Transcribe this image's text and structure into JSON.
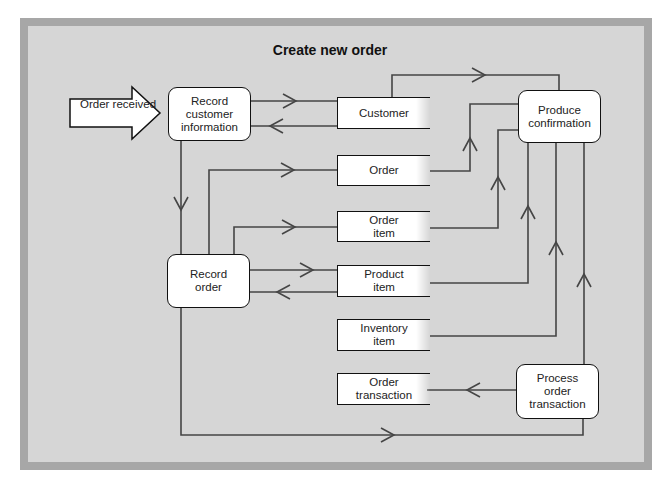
{
  "diagram": {
    "title": "Create new order",
    "external_input": {
      "label": "Order received"
    },
    "processes": {
      "record_customer_information": "Record\ncustomer\ninformation",
      "record_order": "Record\norder",
      "produce_confirmation": "Produce\nconfirmation",
      "process_order_transaction": "Process\norder\ntransaction"
    },
    "data_stores": {
      "customer": "Customer",
      "order": "Order",
      "order_item": "Order\nitem",
      "product_item": "Product\nitem",
      "inventory_item": "Inventory\nitem",
      "order_transaction": "Order\ntransaction"
    },
    "flows": [
      {
        "from": "Order received",
        "to": "Record customer information"
      },
      {
        "from": "Record customer information",
        "to": "Customer"
      },
      {
        "from": "Customer",
        "to": "Record customer information"
      },
      {
        "from": "Record customer information",
        "to": "Record order"
      },
      {
        "from": "Record order",
        "to": "Order"
      },
      {
        "from": "Record order",
        "to": "Order item"
      },
      {
        "from": "Record order",
        "to": "Product item"
      },
      {
        "from": "Product item",
        "to": "Record order"
      },
      {
        "from": "Record order",
        "to": "Process order transaction"
      },
      {
        "from": "Process order transaction",
        "to": "Order transaction"
      },
      {
        "from": "Process order transaction",
        "to": "Produce confirmation"
      },
      {
        "from": "Customer",
        "to": "Produce confirmation"
      },
      {
        "from": "Order",
        "to": "Produce confirmation"
      },
      {
        "from": "Order item",
        "to": "Produce confirmation"
      },
      {
        "from": "Product item",
        "to": "Produce confirmation"
      },
      {
        "from": "Inventory item",
        "to": "Produce confirmation"
      }
    ],
    "colors": {
      "frame": "#a7a7a7",
      "panel": "#d6d6d6",
      "line": "#444444",
      "box": "#ffffff"
    }
  }
}
